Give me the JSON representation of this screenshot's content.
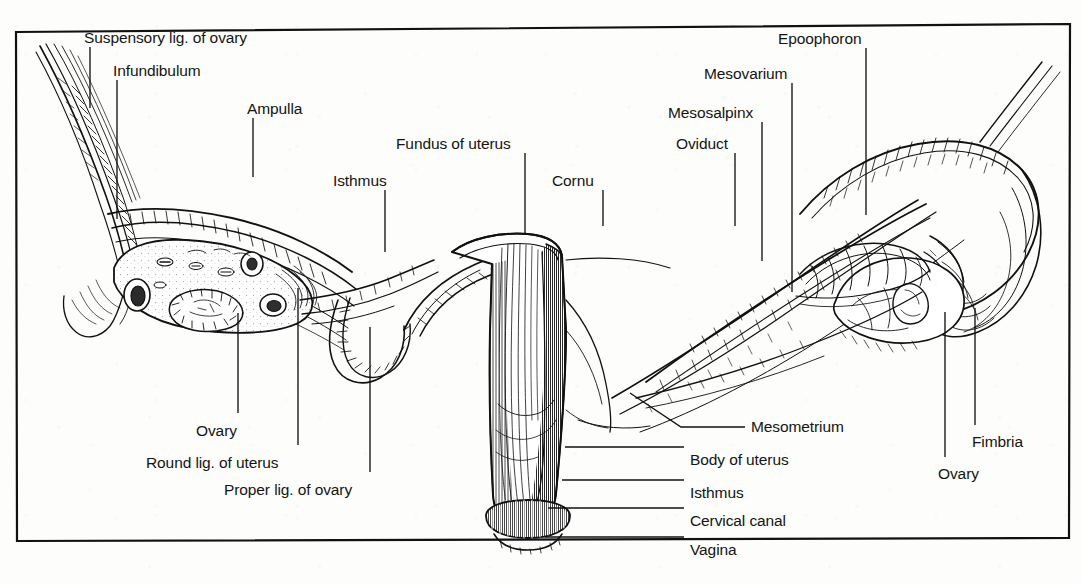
{
  "figure": {
    "border_color": "#111111",
    "ink_color": "#111111",
    "paper_color": "#fdfdfb",
    "width": 1082,
    "height": 584
  },
  "labels": [
    {
      "id": "suspensory-ligament-of-ovary",
      "text": "Suspensory lig. of ovary",
      "x": 84,
      "y": 30,
      "align": "left"
    },
    {
      "id": "infundibulum",
      "text": "Infundibulum",
      "x": 113,
      "y": 63,
      "align": "left"
    },
    {
      "id": "ampulla",
      "text": "Ampulla",
      "x": 247,
      "y": 101,
      "align": "left"
    },
    {
      "id": "isthmus-top",
      "text": "Isthmus",
      "x": 333,
      "y": 173,
      "align": "left"
    },
    {
      "id": "fundus-of-uterus",
      "text": "Fundus of uterus",
      "x": 396,
      "y": 136,
      "align": "left"
    },
    {
      "id": "cornu",
      "text": "Cornu",
      "x": 552,
      "y": 173,
      "align": "left"
    },
    {
      "id": "oviduct",
      "text": "Oviduct",
      "x": 676,
      "y": 136,
      "align": "left"
    },
    {
      "id": "mesosalpinx",
      "text": "Mesosalpinx",
      "x": 668,
      "y": 105,
      "align": "left"
    },
    {
      "id": "mesovarium",
      "text": "Mesovarium",
      "x": 704,
      "y": 66,
      "align": "left"
    },
    {
      "id": "epoophoron",
      "text": "Epoophoron",
      "x": 778,
      "y": 31,
      "align": "left"
    },
    {
      "id": "ovary-left",
      "text": "Ovary",
      "x": 196,
      "y": 423,
      "align": "left"
    },
    {
      "id": "round-ligament-of-uterus",
      "text": "Round lig. of uterus",
      "x": 146,
      "y": 455,
      "align": "left"
    },
    {
      "id": "proper-ligament-of-ovary",
      "text": "Proper lig. of ovary",
      "x": 224,
      "y": 482,
      "align": "left"
    },
    {
      "id": "mesometrium",
      "text": "Mesometrium",
      "x": 751,
      "y": 419,
      "align": "left"
    },
    {
      "id": "body-of-uterus",
      "text": "Body of uterus",
      "x": 690,
      "y": 452,
      "align": "left"
    },
    {
      "id": "isthmus-bottom",
      "text": "Isthmus",
      "x": 690,
      "y": 485,
      "align": "left"
    },
    {
      "id": "cervical-canal",
      "text": "Cervical canal",
      "x": 690,
      "y": 513,
      "align": "left"
    },
    {
      "id": "vagina",
      "text": "Vagina",
      "x": 690,
      "y": 542,
      "align": "left"
    },
    {
      "id": "fimbria",
      "text": "Fimbria",
      "x": 972,
      "y": 434,
      "align": "left"
    },
    {
      "id": "ovary-right",
      "text": "Ovary",
      "x": 938,
      "y": 466,
      "align": "left"
    }
  ],
  "leader_lines": [
    {
      "id": "leader-suspensory-ligament-of-ovary",
      "points": "90,47 90,108"
    },
    {
      "id": "leader-infundibulum",
      "points": "117,80 117,219"
    },
    {
      "id": "leader-ampulla",
      "points": "253,118 253,177"
    },
    {
      "id": "leader-isthmus-top",
      "points": "385,190 385,252"
    },
    {
      "id": "leader-fundus-of-uterus",
      "points": "525,153 525,233"
    },
    {
      "id": "leader-cornu",
      "points": "603,190 603,226"
    },
    {
      "id": "leader-oviduct",
      "points": "735,153 735,226"
    },
    {
      "id": "leader-mesosalpinx",
      "points": "762,122 762,261"
    },
    {
      "id": "leader-mesovarium",
      "points": "792,83 792,292"
    },
    {
      "id": "leader-epoophoron",
      "points": "866,48 866,215"
    },
    {
      "id": "leader-ovary-left",
      "points": "238,313 238,413"
    },
    {
      "id": "leader-round-ligament-of-uterus",
      "points": "298,288 298,445"
    },
    {
      "id": "leader-proper-ligament-of-ovary",
      "points": "370,327 370,472"
    },
    {
      "id": "leader-mesometrium",
      "points": "630,393 681,427 745,427"
    },
    {
      "id": "leader-body-of-uterus",
      "points": "565,447 684,447"
    },
    {
      "id": "leader-isthmus-bottom",
      "points": "562,480 684,480"
    },
    {
      "id": "leader-cervical-canal",
      "points": "548,508 684,508"
    },
    {
      "id": "leader-vagina",
      "points": "545,537 684,537"
    },
    {
      "id": "leader-fimbria",
      "points": "975,308 975,425"
    },
    {
      "id": "leader-ovary-right",
      "points": "945,312 945,457"
    }
  ]
}
